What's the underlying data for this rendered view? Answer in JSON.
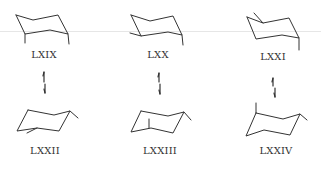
{
  "diagram": {
    "type": "conformational-equilibria",
    "line_color": "#333333",
    "background": "#ffffff",
    "top_row": [
      {
        "id": "LXIX",
        "label": "LXIX"
      },
      {
        "id": "LXX",
        "label": "LXX"
      },
      {
        "id": "LXXI",
        "label": "LXXI"
      }
    ],
    "bottom_row": [
      {
        "id": "LXXII",
        "label": "LXXII"
      },
      {
        "id": "LXXIII",
        "label": "LXXIII"
      },
      {
        "id": "LXXIV",
        "label": "LXXIV"
      }
    ],
    "equilibria": [
      {
        "from": "LXIX",
        "to": "LXXII",
        "arrow": "equilibrium-vertical"
      },
      {
        "from": "LXX",
        "to": "LXXIII",
        "arrow": "equilibrium-vertical"
      },
      {
        "from": "LXXI",
        "to": "LXXIV",
        "arrow": "equilibrium-vertical"
      }
    ]
  }
}
